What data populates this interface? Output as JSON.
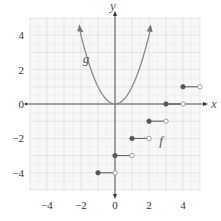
{
  "chart_data": {
    "type": "line",
    "title": "",
    "xlabel": "x",
    "ylabel": "y",
    "xlim": [
      -5,
      5
    ],
    "ylim": [
      -5,
      5
    ],
    "grid": true,
    "x_ticks": [
      -4,
      -2,
      0,
      2,
      4
    ],
    "y_ticks": [
      -4,
      -2,
      0,
      2,
      4
    ],
    "x_tick_labels": [
      "−4",
      "−2",
      "0",
      "2",
      "4"
    ],
    "y_tick_labels": [
      "−4",
      "−2",
      "0",
      "2",
      "4"
    ],
    "series": [
      {
        "name": "g",
        "label": "g",
        "kind": "parabola",
        "equation": "g(x) = x^2",
        "x": [
          -2.1,
          -1.5,
          -1,
          -0.5,
          0,
          0.5,
          1,
          1.5,
          2.1
        ],
        "y": [
          4.41,
          2.25,
          1,
          0.25,
          0,
          0.25,
          1,
          2.25,
          4.41
        ],
        "arrows_both_ends": true,
        "color": "#8a8a8a"
      },
      {
        "name": "f",
        "label": "f",
        "kind": "step",
        "equation": "f(x) = floor(x) - 3",
        "segments": [
          {
            "x_start": -1,
            "x_end": 0,
            "y": -4,
            "start_closed": true,
            "end_closed": false
          },
          {
            "x_start": 0,
            "x_end": 1,
            "y": -3,
            "start_closed": true,
            "end_closed": false
          },
          {
            "x_start": 1,
            "x_end": 2,
            "y": -2,
            "start_closed": true,
            "end_closed": false
          },
          {
            "x_start": 2,
            "x_end": 3,
            "y": -1,
            "start_closed": true,
            "end_closed": false
          },
          {
            "x_start": 3,
            "x_end": 4,
            "y": 0,
            "start_closed": true,
            "end_closed": false
          },
          {
            "x_start": 4,
            "x_end": 5,
            "y": 1,
            "start_closed": true,
            "end_closed": false
          }
        ],
        "color": "#555555"
      }
    ],
    "annotations": [
      {
        "text": "g",
        "x": -1.9,
        "y": 2.4
      },
      {
        "text": "f",
        "x": 2.6,
        "y": -2.4
      }
    ]
  },
  "axes": {
    "x_label": "x",
    "y_label": "y"
  },
  "labels": {
    "g": "g",
    "f": "f"
  }
}
